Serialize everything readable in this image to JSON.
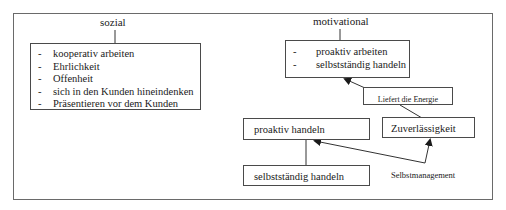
{
  "diagram": {
    "social": {
      "title": "sozial",
      "items": [
        "kooperativ arbeiten",
        "Ehrlichkeit",
        "Offenheit",
        "sich in den Kunden hineindenken",
        "Präsentieren vor dem Kunden"
      ]
    },
    "motivational": {
      "title": "motivational",
      "items": [
        "proaktiv arbeiten",
        "selbstständig handeln"
      ]
    },
    "energy_box": "Liefert die Energie",
    "reliability_box": "Zuverlässigkeit",
    "proactive_box": "proaktiv handeln",
    "independent_box": "selbstständig handeln",
    "self_management_label": "Selbstmanagement"
  }
}
